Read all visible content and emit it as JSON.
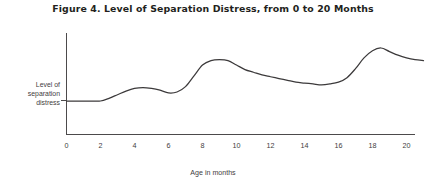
{
  "figure": {
    "title": "Figure 4. Level of Separation Distress, from 0 to 20 Months",
    "background_color": "#ffffff",
    "ink_color": "#231f20",
    "curve_color": "#3c3a3b",
    "axis_color": "#4c4a4b"
  },
  "axes": {
    "y_label_lines": [
      "Level of",
      "separation",
      "distress"
    ],
    "y_label_full": "Level of separation distress",
    "x_title": "Age in months",
    "x_ticks": [
      "0",
      "2",
      "4",
      "6",
      "8",
      "10",
      "12",
      "14",
      "16",
      "18",
      "20"
    ]
  },
  "chart_data": {
    "type": "line",
    "title": "Figure 4. Level of Separation Distress, from 0 to 20 Months",
    "xlabel": "Age in months",
    "ylabel": "Level of separation distress",
    "xlim": [
      0,
      21.5
    ],
    "ylim": [
      0,
      100
    ],
    "grid": false,
    "legend": false,
    "x_ticks": [
      0,
      2,
      4,
      6,
      8,
      10,
      12,
      14,
      16,
      18,
      20
    ],
    "y_ticks": [],
    "series": [
      {
        "name": "Level of separation distress",
        "x": [
          0,
          0.5,
          1,
          1.5,
          2,
          2.5,
          3,
          3.5,
          4,
          4.5,
          5,
          5.5,
          6,
          6.5,
          7,
          7.5,
          8,
          8.5,
          9,
          9.5,
          10,
          10.5,
          11,
          11.5,
          12,
          12.5,
          13,
          13.5,
          14,
          14.5,
          15,
          15.5,
          16,
          16.5,
          17,
          17.5,
          18,
          18.5,
          19,
          19.5,
          20,
          20.5,
          21
        ],
        "y": [
          32,
          32,
          32,
          32,
          32,
          35,
          39,
          43,
          46,
          47,
          46,
          44,
          41,
          42,
          48,
          60,
          72,
          77,
          78,
          77,
          72,
          67,
          64,
          61,
          59,
          57,
          55,
          53,
          52,
          51,
          50,
          51,
          53,
          58,
          68,
          80,
          88,
          91,
          87,
          83,
          80,
          78,
          77
        ]
      }
    ],
    "annotations": [
      {
        "text": "baseline plateau, months 0-2",
        "x_range": [
          0,
          2
        ]
      },
      {
        "text": "first small rise peaking near month 4",
        "x": 4,
        "y": 47
      },
      {
        "text": "major peak near months 8-9",
        "x": 8.8,
        "y": 78
      },
      {
        "text": "trough near months 14-15",
        "x": 15,
        "y": 50
      },
      {
        "text": "highest peak near month 18.5",
        "x": 18.5,
        "y": 91
      }
    ]
  }
}
